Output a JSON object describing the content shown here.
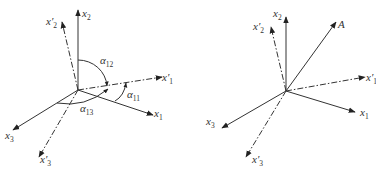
{
  "left_diagram": {
    "axes": {
      "x1": {
        "base": "x",
        "sub": "1"
      },
      "x2": {
        "base": "x",
        "sub": "2"
      },
      "x3": {
        "base": "x",
        "sub": "3"
      },
      "x1p": {
        "base": "x′",
        "sub": "1"
      },
      "x2p": {
        "base": "x′",
        "sub": "2"
      },
      "x3p": {
        "base": "x′",
        "sub": "3"
      }
    },
    "angles": {
      "a12": {
        "base": "α",
        "sub": "12"
      },
      "a11": {
        "base": "α",
        "sub": "11"
      },
      "a13": {
        "base": "α",
        "sub": "13"
      }
    }
  },
  "right_diagram": {
    "axes": {
      "x1": {
        "base": "x",
        "sub": "1"
      },
      "x2": {
        "base": "x",
        "sub": "2"
      },
      "x3": {
        "base": "x",
        "sub": "3"
      },
      "x1p": {
        "base": "x′",
        "sub": "1"
      },
      "x2p": {
        "base": "x′",
        "sub": "2"
      },
      "x3p": {
        "base": "x′",
        "sub": "3"
      }
    },
    "vector": {
      "label": "A"
    }
  }
}
